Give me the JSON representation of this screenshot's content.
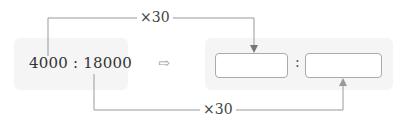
{
  "left": {
    "ratio": "4000 : 18000",
    "first_term": "4000",
    "second_term": "18000"
  },
  "transform_arrow": "⇨",
  "right": {
    "colon": ":",
    "first_blank": "",
    "second_blank": ""
  },
  "multipliers": {
    "top": "×30",
    "bottom": "×30"
  },
  "colors": {
    "panel_bg": "#f5f5f5",
    "line": "#999999",
    "box_border": "#aaaaaa"
  }
}
